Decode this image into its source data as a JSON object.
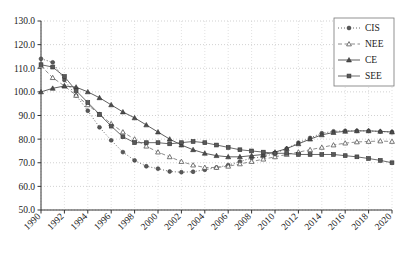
{
  "chart_data": {
    "type": "line",
    "title": "",
    "xlabel": "",
    "ylabel": "",
    "xlim": [
      1990,
      2020
    ],
    "ylim": [
      50.0,
      130.0
    ],
    "grid": true,
    "legend_position": "top-right",
    "x": [
      1990,
      1991,
      1992,
      1993,
      1994,
      1995,
      1996,
      1997,
      1998,
      1999,
      2000,
      2001,
      2002,
      2003,
      2004,
      2005,
      2006,
      2007,
      2008,
      2009,
      2010,
      2011,
      2012,
      2013,
      2014,
      2015,
      2016,
      2017,
      2018,
      2019,
      2020
    ],
    "xticks": [
      "1990",
      "1992",
      "1994",
      "1996",
      "1998",
      "2000",
      "2002",
      "2004",
      "2006",
      "2008",
      "2010",
      "2012",
      "2014",
      "2016",
      "2018",
      "2020"
    ],
    "yticks": [
      "50.0",
      "60.0",
      "70.0",
      "80.0",
      "90.0",
      "100.0",
      "110.0",
      "120.0",
      "130.0"
    ],
    "series": [
      {
        "name": "CIS",
        "marker": "filled-circle",
        "line_style": "dotted",
        "color": "#595959",
        "values": [
          114.0,
          112.5,
          105.0,
          98.5,
          92.0,
          85.0,
          79.5,
          74.5,
          71.0,
          68.5,
          67.5,
          66.3,
          66.0,
          66.2,
          67.0,
          68.0,
          69.0,
          70.5,
          72.0,
          72.5,
          74.0,
          76.0,
          78.5,
          80.5,
          82.5,
          83.3,
          83.5,
          83.5,
          83.5,
          83.2,
          83.0
        ]
      },
      {
        "name": "NEE",
        "marker": "open-triangle",
        "line_style": "dashed",
        "color": "#808080",
        "values": [
          111.0,
          106.0,
          102.5,
          98.5,
          94.5,
          90.5,
          86.5,
          83.0,
          80.0,
          77.0,
          74.5,
          72.5,
          70.5,
          69.0,
          68.0,
          68.0,
          68.5,
          69.5,
          70.5,
          71.5,
          72.5,
          73.5,
          74.5,
          75.5,
          76.5,
          77.5,
          78.3,
          78.8,
          79.0,
          79.2,
          79.0
        ]
      },
      {
        "name": "CE",
        "marker": "filled-triangle",
        "line_style": "solid",
        "color": "#4d4d4d",
        "values": [
          100.0,
          101.5,
          102.5,
          102.0,
          100.0,
          97.5,
          94.5,
          91.5,
          89.0,
          86.0,
          83.0,
          80.0,
          77.5,
          75.5,
          74.0,
          73.0,
          72.5,
          72.5,
          73.0,
          73.5,
          74.5,
          76.0,
          78.0,
          80.0,
          81.8,
          82.8,
          83.3,
          83.5,
          83.5,
          83.3,
          83.0
        ]
      },
      {
        "name": "SEE",
        "marker": "filled-square",
        "line_style": "solid",
        "color": "#595959",
        "values": [
          111.5,
          110.5,
          106.5,
          100.5,
          95.5,
          90.5,
          85.5,
          81.0,
          78.5,
          78.5,
          78.5,
          78.0,
          78.5,
          79.0,
          78.5,
          77.5,
          76.5,
          75.5,
          75.0,
          74.5,
          74.0,
          74.0,
          73.5,
          73.5,
          73.5,
          73.5,
          73.0,
          72.5,
          71.8,
          71.0,
          70.0
        ]
      }
    ]
  },
  "legend": {
    "items": [
      {
        "label": "CIS"
      },
      {
        "label": "NEE"
      },
      {
        "label": "CE"
      },
      {
        "label": "SEE"
      }
    ]
  }
}
